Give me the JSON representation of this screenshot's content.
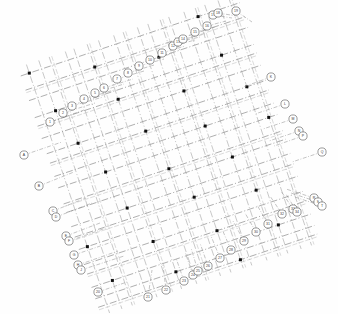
{
  "drawing": {
    "type": "structural-column-grid-plan",
    "title": "Structural Grid Plan",
    "background_color": "#fefefe",
    "gridline_color": "#7d7d7d",
    "column_color": "#101010",
    "bubble_stroke_color": "#5a5a5a",
    "bubble_fill_color": "#ffffff",
    "rotation_degrees": -18.5,
    "linetype": "dash-dot centerline",
    "column_marker_shape": "filled-square",
    "bubble_shape": "circle",
    "bubble_diameter_px": 8,
    "canvas": {
      "width": 338,
      "height": 314
    }
  },
  "grid": {
    "origin": {
      "x": 60,
      "y": 152
    },
    "axis_a_angle_degrees": -18.5,
    "axis_b_angle_degrees": 71.5,
    "axis_a_label": "horizontal-gridline-family",
    "axis_b_label": "vertical-gridline-family",
    "axis_a_spacings_px": [
      13,
      11,
      17,
      9,
      14,
      12,
      16,
      10,
      15,
      11,
      13,
      9,
      16,
      12,
      10,
      14,
      11
    ],
    "axis_b_spacings_px": [
      15,
      11,
      18,
      9,
      13,
      16,
      10,
      14,
      12,
      17,
      9,
      15,
      11,
      13,
      16,
      10,
      14,
      12,
      9
    ],
    "axis_a_count": 18,
    "axis_b_count": 20
  },
  "bubbles": {
    "top_left_run": [
      {
        "label": "A",
        "cx": 24,
        "cy": 155,
        "lx": 62,
        "ly": 142
      },
      {
        "label": "B",
        "cx": 39,
        "cy": 186,
        "lx": 74,
        "ly": 172
      },
      {
        "label": "C",
        "cx": 53,
        "cy": 211,
        "lx": 86,
        "ly": 198
      },
      {
        "label": "D",
        "cx": 56,
        "cy": 217,
        "lx": 92,
        "ly": 203
      },
      {
        "label": "E",
        "cx": 66,
        "cy": 236,
        "lx": 100,
        "ly": 223
      },
      {
        "label": "F",
        "cx": 69,
        "cy": 241,
        "lx": 106,
        "ly": 228
      },
      {
        "label": "G",
        "cx": 74,
        "cy": 255,
        "lx": 112,
        "ly": 242
      },
      {
        "label": "H",
        "cx": 78,
        "cy": 265,
        "lx": 118,
        "ly": 251
      },
      {
        "label": "J",
        "cx": 81,
        "cy": 270,
        "lx": 124,
        "ly": 256
      }
    ],
    "top_run": [
      {
        "label": "1",
        "cx": 50,
        "cy": 122,
        "lx": 84,
        "ly": 110
      },
      {
        "label": "2",
        "cx": 63,
        "cy": 113,
        "lx": 95,
        "ly": 103
      },
      {
        "label": "3",
        "cx": 72,
        "cy": 106,
        "lx": 103,
        "ly": 97
      },
      {
        "label": "4",
        "cx": 84,
        "cy": 99,
        "lx": 114,
        "ly": 90
      },
      {
        "label": "5",
        "cx": 95,
        "cy": 93,
        "lx": 124,
        "ly": 84
      },
      {
        "label": "6",
        "cx": 104,
        "cy": 88,
        "lx": 133,
        "ly": 79
      },
      {
        "label": "7",
        "cx": 117,
        "cy": 79,
        "lx": 144,
        "ly": 71
      },
      {
        "label": "8",
        "cx": 128,
        "cy": 73,
        "lx": 154,
        "ly": 65
      },
      {
        "label": "9",
        "cx": 139,
        "cy": 66,
        "lx": 164,
        "ly": 59
      },
      {
        "label": "10",
        "cx": 150,
        "cy": 60,
        "lx": 174,
        "ly": 53
      },
      {
        "label": "11",
        "cx": 162,
        "cy": 53,
        "lx": 185,
        "ly": 46
      },
      {
        "label": "12",
        "cx": 173,
        "cy": 46,
        "lx": 195,
        "ly": 40
      },
      {
        "label": "13",
        "cx": 178,
        "cy": 42,
        "lx": 200,
        "ly": 37
      },
      {
        "label": "14",
        "cx": 183,
        "cy": 39,
        "lx": 205,
        "ly": 34
      },
      {
        "label": "15",
        "cx": 195,
        "cy": 32,
        "lx": 215,
        "ly": 27
      },
      {
        "label": "16",
        "cx": 207,
        "cy": 26,
        "lx": 226,
        "ly": 21
      },
      {
        "label": "17",
        "cx": 213,
        "cy": 15,
        "lx": 232,
        "ly": 18
      },
      {
        "label": "18",
        "cx": 218,
        "cy": 13,
        "lx": 237,
        "ly": 16
      },
      {
        "label": "19",
        "cx": 236,
        "cy": 11,
        "lx": 252,
        "ly": 22
      }
    ],
    "right_run": [
      {
        "label": "K",
        "cx": 271,
        "cy": 77,
        "lx": 243,
        "ly": 87
      },
      {
        "label": "L",
        "cx": 285,
        "cy": 104,
        "lx": 255,
        "ly": 114
      },
      {
        "label": "M",
        "cx": 293,
        "cy": 119,
        "lx": 263,
        "ly": 129
      },
      {
        "label": "N",
        "cx": 299,
        "cy": 131,
        "lx": 269,
        "ly": 141
      },
      {
        "label": "P",
        "cx": 303,
        "cy": 136,
        "lx": 274,
        "ly": 146
      },
      {
        "label": "Q",
        "cx": 322,
        "cy": 152,
        "lx": 292,
        "ly": 162
      },
      {
        "label": "R",
        "cx": 314,
        "cy": 198,
        "lx": 286,
        "ly": 189
      },
      {
        "label": "S",
        "cx": 318,
        "cy": 202,
        "lx": 291,
        "ly": 193
      },
      {
        "label": "T",
        "cx": 322,
        "cy": 206,
        "lx": 295,
        "ly": 197
      }
    ],
    "bottom_run": [
      {
        "label": "20",
        "cx": 98,
        "cy": 292,
        "lx": 127,
        "ly": 282
      },
      {
        "label": "21",
        "cx": 148,
        "cy": 297,
        "lx": 152,
        "ly": 270
      },
      {
        "label": "22",
        "cx": 166,
        "cy": 290,
        "lx": 163,
        "ly": 265
      },
      {
        "label": "23",
        "cx": 184,
        "cy": 281,
        "lx": 176,
        "ly": 258
      },
      {
        "label": "24",
        "cx": 193,
        "cy": 275,
        "lx": 185,
        "ly": 252
      },
      {
        "label": "25",
        "cx": 198,
        "cy": 271,
        "lx": 191,
        "ly": 248
      },
      {
        "label": "26",
        "cx": 208,
        "cy": 266,
        "lx": 200,
        "ly": 243
      },
      {
        "label": "27",
        "cx": 220,
        "cy": 258,
        "lx": 211,
        "ly": 236
      },
      {
        "label": "28",
        "cx": 231,
        "cy": 250,
        "lx": 222,
        "ly": 229
      },
      {
        "label": "29",
        "cx": 244,
        "cy": 241,
        "lx": 233,
        "ly": 221
      },
      {
        "label": "30",
        "cx": 256,
        "cy": 232,
        "lx": 245,
        "ly": 213
      },
      {
        "label": "31",
        "cx": 268,
        "cy": 224,
        "lx": 257,
        "ly": 205
      },
      {
        "label": "32",
        "cx": 282,
        "cy": 214,
        "lx": 270,
        "ly": 196
      },
      {
        "label": "33",
        "cx": 293,
        "cy": 209,
        "lx": 281,
        "ly": 191
      },
      {
        "label": "34",
        "cx": 297,
        "cy": 212,
        "lx": 286,
        "ly": 194
      }
    ]
  },
  "legend": {
    "column_marker_note": "filled square = column",
    "bubble_note": "circle = grid reference bubble"
  }
}
